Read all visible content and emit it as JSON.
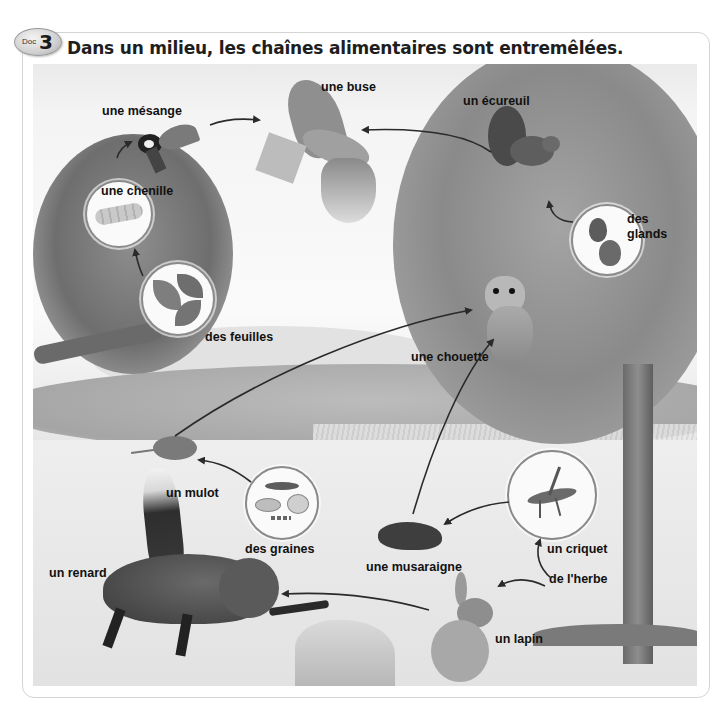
{
  "header": {
    "badge_prefix": "Doc",
    "badge_number": "3",
    "title": "Dans un milieu, les chaînes alimentaires sont entremêlées."
  },
  "labels": {
    "mesange": "une mésange",
    "buse": "une buse",
    "ecureuil": "un écureuil",
    "chenille": "une chenille",
    "glands": "des glands",
    "glands_line1": "des",
    "glands_line2": "glands",
    "feuilles": "des feuilles",
    "chouette": "une chouette",
    "mulot": "un mulot",
    "graines": "des graines",
    "renard": "un renard",
    "musaraigne": "une musaraigne",
    "criquet": "un criquet",
    "herbe": "de l'herbe",
    "lapin": "un lapin"
  },
  "food_web": [
    {
      "from": "des feuilles",
      "to": "une chenille"
    },
    {
      "from": "une chenille",
      "to": "une mésange"
    },
    {
      "from": "une mésange",
      "to": "une buse"
    },
    {
      "from": "un écureuil",
      "to": "une buse"
    },
    {
      "from": "des glands",
      "to": "un écureuil"
    },
    {
      "from": "un mulot",
      "to": "une chouette"
    },
    {
      "from": "des graines",
      "to": "un mulot"
    },
    {
      "from": "une musaraigne",
      "to": "une chouette"
    },
    {
      "from": "un criquet",
      "to": "une musaraigne"
    },
    {
      "from": "de l'herbe",
      "to": "un criquet"
    },
    {
      "from": "de l'herbe",
      "to": "un lapin"
    },
    {
      "from": "un lapin",
      "to": "un renard"
    }
  ],
  "colors": {
    "text": "#111111",
    "arrow": "#2a2a2a",
    "frame_border": "#d4d4d4",
    "bubble_border": "#8a8a8a"
  }
}
